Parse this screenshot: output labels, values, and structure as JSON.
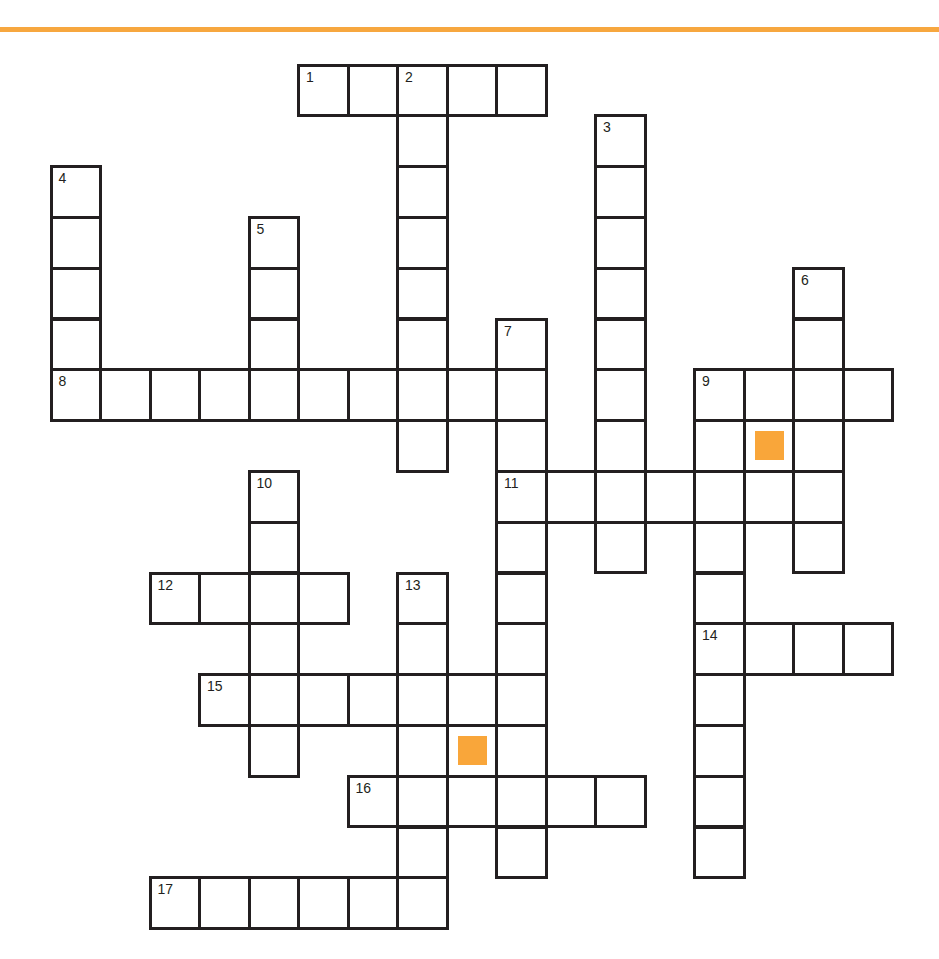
{
  "colors": {
    "accent_bar": "#F7A73F",
    "marker": "#F9A63A",
    "grid_line": "#231F20",
    "cell_bg": "#FFFFFF"
  },
  "grid": {
    "origin_x": 51,
    "origin_y": 65,
    "pitch_x": 49.5,
    "pitch_y": 50.8,
    "rows": 17,
    "cols": 17
  },
  "entries": [
    {
      "number": "1",
      "direction": "across",
      "row": 0,
      "col": 5,
      "length": 5
    },
    {
      "number": "2",
      "direction": "down",
      "row": 0,
      "col": 7,
      "length": 8
    },
    {
      "number": "3",
      "direction": "down",
      "row": 1,
      "col": 11,
      "length": 9
    },
    {
      "number": "4",
      "direction": "down",
      "row": 2,
      "col": 0,
      "length": 5
    },
    {
      "number": "5",
      "direction": "down",
      "row": 3,
      "col": 4,
      "length": 4
    },
    {
      "number": "6",
      "direction": "down",
      "row": 4,
      "col": 15,
      "length": 6
    },
    {
      "number": "7",
      "direction": "down",
      "row": 5,
      "col": 9,
      "length": 11
    },
    {
      "number": "8",
      "direction": "across",
      "row": 6,
      "col": 0,
      "length": 10
    },
    {
      "number": "9",
      "direction": "across",
      "row": 6,
      "col": 13,
      "length": 4
    },
    {
      "number": "9",
      "direction": "down",
      "row": 6,
      "col": 13,
      "length": 10
    },
    {
      "number": "10",
      "direction": "down",
      "row": 8,
      "col": 4,
      "length": 6
    },
    {
      "number": "11",
      "direction": "across",
      "row": 8,
      "col": 9,
      "length": 7
    },
    {
      "number": "12",
      "direction": "across",
      "row": 10,
      "col": 2,
      "length": 4
    },
    {
      "number": "13",
      "direction": "down",
      "row": 10,
      "col": 7,
      "length": 7
    },
    {
      "number": "14",
      "direction": "across",
      "row": 11,
      "col": 13,
      "length": 4
    },
    {
      "number": "15",
      "direction": "across",
      "row": 12,
      "col": 3,
      "length": 7
    },
    {
      "number": "16",
      "direction": "across",
      "row": 14,
      "col": 6,
      "length": 6
    },
    {
      "number": "17",
      "direction": "across",
      "row": 16,
      "col": 2,
      "length": 6
    }
  ],
  "extra_cells": [
    {
      "row": 7,
      "col": 14,
      "marker": true
    },
    {
      "row": 13,
      "col": 8,
      "marker": true
    }
  ]
}
